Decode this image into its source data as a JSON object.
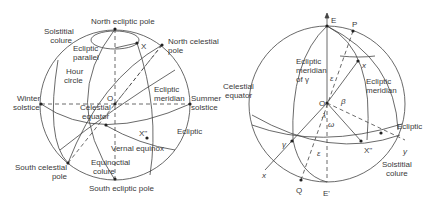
{
  "left_diagram": {
    "labels": {
      "north_ecliptic_pole": "North ecliptic pole",
      "solstitial_colure_1": "Solstitial",
      "solstitial_colure_2": "colure",
      "ecliptic_parallel_1": "Ecliptic",
      "ecliptic_parallel_2": "parallel",
      "x_point": "X",
      "north_celestial_pole_1": "North celestial",
      "north_celestial_pole_2": "pole",
      "hour_circle_1": "Hour",
      "hour_circle_2": "circle",
      "winter_solstice_1": "Winter",
      "winter_solstice_2": "solstice",
      "origin": "O",
      "ecliptic_meridian_1": "Ecliptic",
      "ecliptic_meridian_2": "meridian",
      "summer_solstice_1": "Summer",
      "summer_solstice_2": "solstice",
      "celestial_equator_1": "Celestial",
      "celestial_equator_2": "equator",
      "x_double_prime": "X''",
      "ecliptic": "Ecliptic",
      "vernal_equinox": "Vernal equinox",
      "south_celestial_pole_1": "South celestial",
      "south_celestial_pole_2": "pole",
      "equinoctial_colure_1": "Equinoctial",
      "equinoctial_colure_2": "colure",
      "south_ecliptic_pole": "South ecliptic pole"
    }
  },
  "right_diagram": {
    "labels": {
      "E": "E",
      "P": "P",
      "x_point": "x",
      "ecliptic_meridian_gamma_1": "Ecliptic",
      "ecliptic_meridian_gamma_2": "meridian",
      "ecliptic_meridian_gamma_3": "of γ",
      "epsilon_top": "ε",
      "ecliptic_meridian_1": "Ecliptic",
      "ecliptic_meridian_2": "meridian",
      "celestial_equator_1": "Celestial",
      "celestial_equator_2": "equator",
      "origin": "O",
      "beta": "β",
      "lambda": "λ",
      "omega": "ω",
      "ecliptic": "Ecliptic",
      "gamma": "γ",
      "epsilon_bottom": "ε",
      "x_double_prime": "X''",
      "y_axis": "y",
      "x_axis": "x",
      "solstitial_colure_1": "Solstitial",
      "solstitial_colure_2": "colure",
      "Q": "Q",
      "E_prime": "E'"
    }
  }
}
